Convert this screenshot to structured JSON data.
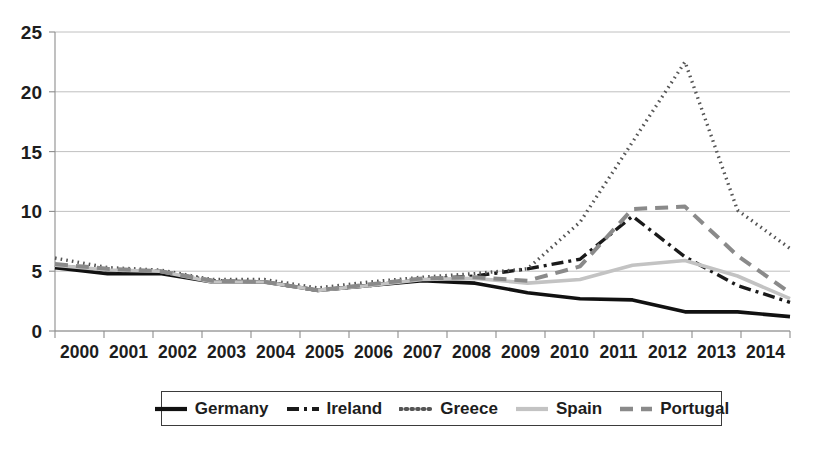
{
  "chart_data": {
    "type": "line",
    "title": "",
    "subtitle": "",
    "xlabel": "",
    "ylabel": "",
    "x": [
      2000,
      2001,
      2002,
      2003,
      2004,
      2005,
      2006,
      2007,
      2008,
      2009,
      2010,
      2011,
      2012,
      2013,
      2014
    ],
    "xtick_labels": [
      "2000",
      "2001",
      "2002",
      "2003",
      "2004",
      "2005",
      "2006",
      "2007",
      "2008",
      "2009",
      "2010",
      "2011",
      "2012",
      "2013",
      "2014"
    ],
    "ytick_labels": [
      "0",
      "5",
      "10",
      "15",
      "20",
      "25"
    ],
    "ytick_values": [
      0,
      5,
      10,
      15,
      20,
      25
    ],
    "ylim": [
      0,
      25
    ],
    "xlim": [
      2000,
      2014
    ],
    "grid": true,
    "legend_position": "bottom",
    "series": [
      {
        "name": "Germany",
        "color": "#111111",
        "style": "solid",
        "dash": "none",
        "width": 3.6,
        "values": [
          5.3,
          4.8,
          4.8,
          4.1,
          4.1,
          3.4,
          3.8,
          4.2,
          4.0,
          3.2,
          2.7,
          2.6,
          1.6,
          1.6,
          1.2
        ]
      },
      {
        "name": "Ireland",
        "color": "#1a1a1a",
        "style": "dash-dot",
        "dash": "12,5,3,5",
        "width": 3.4,
        "values": [
          5.5,
          5.0,
          5.0,
          4.2,
          4.1,
          3.4,
          3.8,
          4.3,
          4.6,
          5.2,
          6.0,
          9.6,
          6.2,
          3.8,
          2.4
        ]
      },
      {
        "name": "Greece",
        "color": "#555555",
        "style": "dotted",
        "dash": "1.6,4.1",
        "width": 3.4,
        "values": [
          6.1,
          5.3,
          5.1,
          4.3,
          4.3,
          3.6,
          4.1,
          4.5,
          4.8,
          5.2,
          9.1,
          15.8,
          22.5,
          10.1,
          6.9
        ]
      },
      {
        "name": "Spain",
        "color": "#c3c3c3",
        "style": "solid",
        "dash": "none",
        "width": 3.6,
        "values": [
          5.5,
          5.1,
          5.0,
          4.1,
          4.1,
          3.4,
          3.8,
          4.3,
          4.4,
          4.0,
          4.3,
          5.5,
          5.9,
          4.6,
          2.7
        ]
      },
      {
        "name": "Portugal",
        "color": "#8a8a8a",
        "style": "dashed",
        "dash": "13,8",
        "width": 4.0,
        "values": [
          5.6,
          5.2,
          5.0,
          4.2,
          4.1,
          3.4,
          3.9,
          4.4,
          4.5,
          4.2,
          5.4,
          10.2,
          10.4,
          6.3,
          3.2
        ]
      }
    ]
  },
  "legend": {
    "items": [
      {
        "label": "Germany",
        "swatch": "solid-black-line-swatch"
      },
      {
        "label": "Ireland",
        "swatch": "dash-dot-black-line-swatch"
      },
      {
        "label": "Greece",
        "swatch": "dotted-gray-line-swatch"
      },
      {
        "label": "Spain",
        "swatch": "solid-lightgray-line-swatch"
      },
      {
        "label": "Portugal",
        "swatch": "dashed-gray-line-swatch"
      }
    ]
  },
  "axes": {
    "y_ticks": [
      "25",
      "20",
      "15",
      "10",
      "5",
      "0"
    ],
    "x_ticks": [
      "2000",
      "2001",
      "2002",
      "2003",
      "2004",
      "2005",
      "2006",
      "2007",
      "2008",
      "2009",
      "2010",
      "2011",
      "2012",
      "2013",
      "2014"
    ]
  },
  "colors": {
    "germany": "#111111",
    "ireland": "#1a1a1a",
    "greece": "#555555",
    "spain": "#c3c3c3",
    "portugal": "#8a8a8a",
    "grid": "#b9b9b9",
    "axis": "#8d8d8d",
    "text": "#1d1d1d"
  }
}
